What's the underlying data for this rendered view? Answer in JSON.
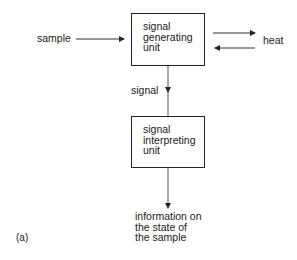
{
  "diagram": {
    "inputs": {
      "sample": "sample"
    },
    "generating_unit": {
      "line1": "signal",
      "line2": "generating",
      "line3": "unit"
    },
    "exchange": {
      "heat": "heat"
    },
    "link": {
      "signal": "signal"
    },
    "interpreting_unit": {
      "line1": "signal",
      "line2": "interpreting",
      "line3": "unit"
    },
    "output": {
      "line1": "information on",
      "line2": "the state of",
      "line3": "the sample"
    },
    "panel_label": "(a)"
  }
}
